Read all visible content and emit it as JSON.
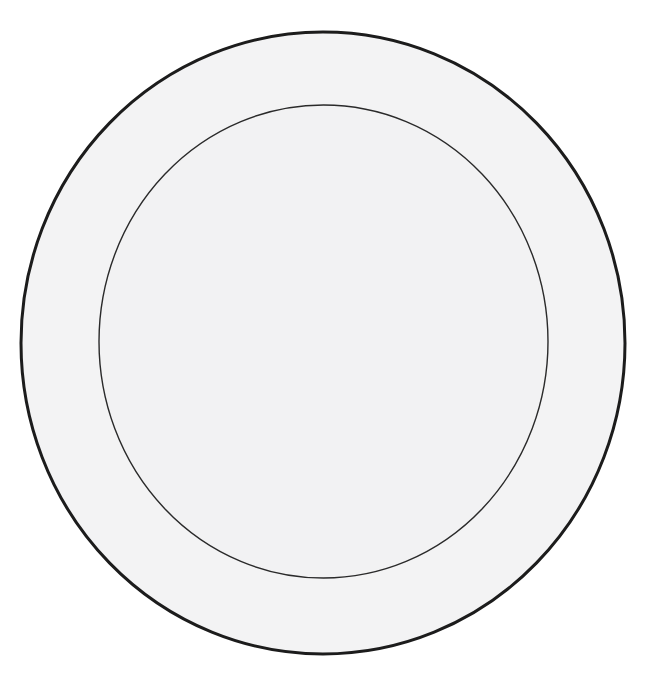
{
  "figure": {
    "subject": "plate",
    "view": "top-down",
    "technique": "ink line drawing, scanned"
  },
  "canvas": {
    "width": 645,
    "height": 673,
    "background_color": "#ffffff"
  },
  "shapes": {
    "outer_circle": {
      "name": "plate-rim",
      "center_x": 323,
      "center_y": 343,
      "radius_x": 302,
      "radius_y": 311,
      "stroke_color": "#1c1c1c",
      "stroke_width": 3,
      "fill_color": "#f3f3f4"
    },
    "inner_circle": {
      "name": "plate-well",
      "center_x": 323.5,
      "center_y": 341.5,
      "radius_x": 224.5,
      "radius_y": 236.5,
      "stroke_color": "#2a2a2a",
      "stroke_width": 1.4,
      "fill_color": "#f2f2f3"
    }
  },
  "paper": {
    "tone_color": "#f3f3f4",
    "rim_band_color": "#f3f3f4",
    "well_color": "#f2f2f3"
  },
  "artifacts": {
    "note": "Faint show-through from the reverse of the scanned page and light smudging along a vertical crease.",
    "ghost_text": [
      {
        "text": "010",
        "x": 96,
        "y": 186,
        "size": 30
      },
      {
        "text": "0210",
        "x": 468,
        "y": 186,
        "size": 30
      },
      {
        "text": "0810",
        "x": 86,
        "y": 296,
        "size": 30
      },
      {
        "text": "0710",
        "x": 452,
        "y": 296,
        "size": 30
      },
      {
        "text": "001",
        "x": 98,
        "y": 400,
        "size": 30
      },
      {
        "text": "0010",
        "x": 462,
        "y": 400,
        "size": 30
      },
      {
        "text": "0190",
        "x": 100,
        "y": 506,
        "size": 30
      },
      {
        "text": "0510",
        "x": 446,
        "y": 506,
        "size": 30
      }
    ],
    "ghost_rules": [
      {
        "x": 60,
        "y": 262,
        "width": 520
      },
      {
        "x": 46,
        "y": 372,
        "width": 552
      },
      {
        "x": 50,
        "y": 478,
        "width": 546
      },
      {
        "x": 80,
        "y": 150,
        "width": 480
      }
    ],
    "smudges": [
      {
        "x": 281,
        "y": 170,
        "width": 74,
        "height": 110
      },
      {
        "x": 292,
        "y": 268,
        "width": 46,
        "height": 86
      },
      {
        "x": 288,
        "y": 370,
        "width": 64,
        "height": 80
      },
      {
        "x": 290,
        "y": 470,
        "width": 60,
        "height": 100
      },
      {
        "x": 272,
        "y": 600,
        "width": 86,
        "height": 46
      }
    ]
  },
  "chart_data": {
    "type": "diagram",
    "elements": [
      {
        "label": "outer rim circle",
        "shape": "circle",
        "cx": 323,
        "cy": 343,
        "rx": 302,
        "ry": 311,
        "stroke_width": 3
      },
      {
        "label": "inner well circle",
        "shape": "circle",
        "cx": 323.5,
        "cy": 341.5,
        "rx": 224.5,
        "ry": 236.5,
        "stroke_width": 1.4
      }
    ],
    "annotations": [],
    "legend": []
  }
}
